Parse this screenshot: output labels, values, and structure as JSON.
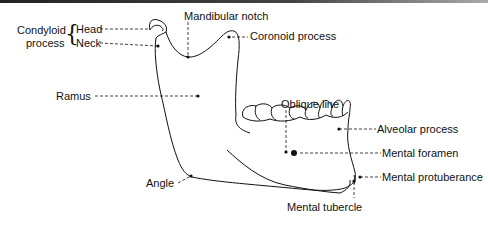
{
  "figure": {
    "labels": {
      "condyloid_process": "Condyloid\nprocess",
      "condyloid_line1": "Condyloid",
      "condyloid_line2": "process",
      "head": "Head",
      "neck": "Neck",
      "mandibular_notch": "Mandibular notch",
      "coronoid_process": "Coronoid process",
      "ramus": "Ramus",
      "oblique_line": "Oblique line",
      "alveolar_process": "Alveolar process",
      "mental_foramen": "Mental foramen",
      "mental_protuberance": "Mental protuberance",
      "angle": "Angle",
      "mental_tubercle": "Mental tubercle"
    },
    "colors": {
      "ink": "#111111",
      "background": "#ffffff"
    }
  }
}
